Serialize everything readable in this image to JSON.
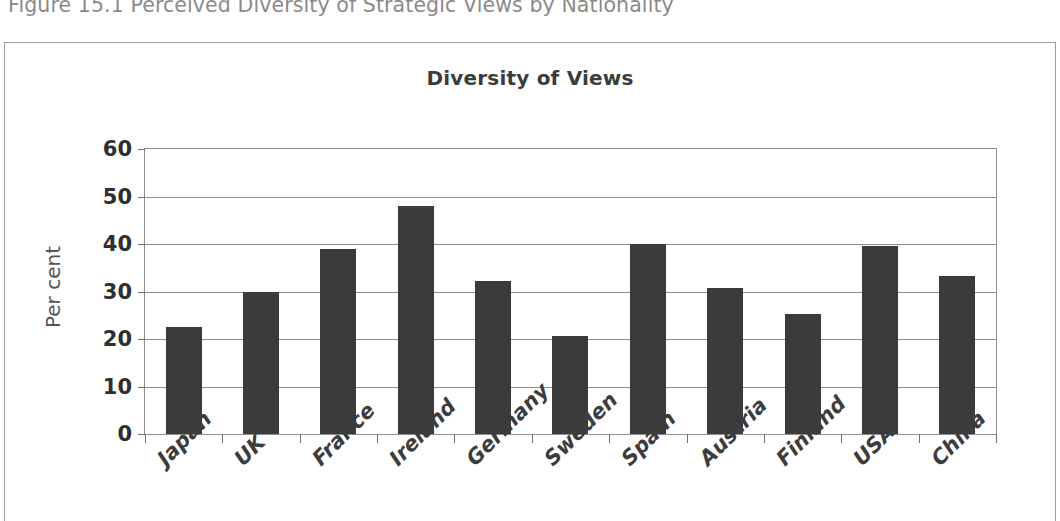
{
  "figure": {
    "caption": "Figure 15.1 Perceived Diversity of Strategic Views by Nationality"
  },
  "chart_data": {
    "type": "bar",
    "title": "Diversity of Views",
    "xlabel": "",
    "ylabel": "Per cent",
    "ylim": [
      0,
      60
    ],
    "ytick_step": 10,
    "yticks": [
      60,
      50,
      40,
      30,
      20,
      10,
      0
    ],
    "grid": "horizontal",
    "legend": "none",
    "bar_color": "#3b3b3b",
    "categories": [
      "Japan",
      "UK",
      "France",
      "Ireland",
      "Germany",
      "Sweden",
      "Spain",
      "Austria",
      "Finland",
      "USA",
      "China"
    ],
    "values": [
      22.5,
      30.0,
      39.0,
      48.0,
      32.3,
      20.7,
      40.0,
      30.7,
      25.3,
      39.5,
      33.3
    ]
  }
}
